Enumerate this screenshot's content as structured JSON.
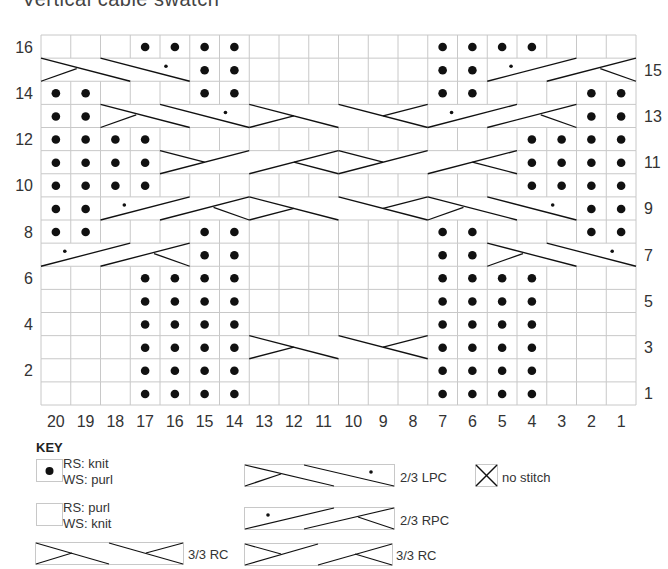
{
  "title": "Vertical cable swatch",
  "chart": {
    "cols": 20,
    "rows": 16,
    "left_row_labels": [
      "16",
      "14",
      "12",
      "10",
      "8",
      "6",
      "4",
      "2"
    ],
    "right_row_labels": [
      "15",
      "13",
      "11",
      "9",
      "7",
      "5",
      "3",
      "1"
    ],
    "column_labels": [
      "20",
      "19",
      "18",
      "17",
      "16",
      "15",
      "14",
      "13",
      "12",
      "11",
      "10",
      "9",
      "8",
      "7",
      "6",
      "5",
      "4",
      "3",
      "2",
      "1"
    ],
    "dots": {
      "16": [
        3,
        4,
        5,
        6,
        13,
        14,
        15,
        16
      ],
      "15": [
        5,
        6,
        13,
        14
      ],
      "14": [
        0,
        1,
        5,
        6,
        13,
        14,
        18,
        19
      ],
      "13": [
        0,
        1,
        18,
        19
      ],
      "12": [
        0,
        1,
        2,
        3,
        16,
        17,
        18,
        19
      ],
      "11": [
        0,
        1,
        2,
        3,
        16,
        17,
        18,
        19
      ],
      "10": [
        0,
        1,
        2,
        3,
        16,
        17,
        18,
        19
      ],
      "9": [
        0,
        1,
        18,
        19
      ],
      "8": [
        0,
        1,
        5,
        6,
        13,
        14,
        18,
        19
      ],
      "7": [
        5,
        6,
        13,
        14
      ],
      "6": [
        3,
        4,
        5,
        6,
        13,
        14,
        15,
        16
      ],
      "5": [
        3,
        4,
        5,
        6,
        13,
        14,
        15,
        16
      ],
      "4": [
        3,
        4,
        5,
        6,
        13,
        14,
        15,
        16
      ],
      "3": [
        3,
        4,
        5,
        6,
        13,
        14,
        15,
        16
      ],
      "2": [
        3,
        4,
        5,
        6,
        13,
        14,
        15,
        16
      ],
      "1": [
        3,
        4,
        5,
        6,
        13,
        14,
        15,
        16
      ]
    },
    "cables": [
      {
        "row": 15,
        "start": 0,
        "width": 5,
        "type": "LPC"
      },
      {
        "row": 15,
        "start": 15,
        "width": 5,
        "type": "RPC"
      },
      {
        "row": 13,
        "start": 2,
        "width": 5,
        "type": "LPC"
      },
      {
        "row": 13,
        "start": 7,
        "width": 6,
        "type": "LC"
      },
      {
        "row": 13,
        "start": 13,
        "width": 5,
        "type": "RPC"
      },
      {
        "row": 11,
        "start": 4,
        "width": 6,
        "type": "RC"
      },
      {
        "row": 11,
        "start": 10,
        "width": 6,
        "type": "RC"
      },
      {
        "row": 9,
        "start": 2,
        "width": 5,
        "type": "RPC"
      },
      {
        "row": 9,
        "start": 7,
        "width": 6,
        "type": "LC"
      },
      {
        "row": 9,
        "start": 13,
        "width": 5,
        "type": "LPC"
      },
      {
        "row": 7,
        "start": 0,
        "width": 5,
        "type": "RPC"
      },
      {
        "row": 7,
        "start": 15,
        "width": 5,
        "type": "LPC"
      },
      {
        "row": 3,
        "start": 7,
        "width": 6,
        "type": "LC"
      }
    ]
  },
  "key": {
    "title": "KEY",
    "items": [
      {
        "symbol": "dot",
        "line1": "RS: knit",
        "line2": "WS: purl"
      },
      {
        "symbol": "blank",
        "line1": "RS: purl",
        "line2": "WS: knit"
      },
      {
        "symbol": "cable-lc",
        "label": "3/3 RC"
      },
      {
        "symbol": "cable-lpc",
        "label": "2/3 LPC"
      },
      {
        "symbol": "cable-rpc",
        "label": "2/3 RPC"
      },
      {
        "symbol": "cable-rc",
        "label": "3/3 RC"
      },
      {
        "symbol": "x",
        "label": "no stitch"
      }
    ]
  },
  "colors": {
    "grid_line": "#c8c8c8",
    "ink": "#111111",
    "label": "#333333"
  }
}
